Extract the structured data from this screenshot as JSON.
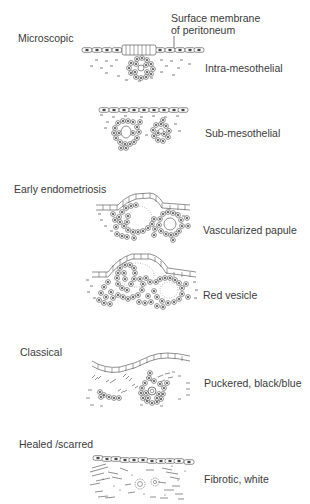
{
  "diagram": {
    "title_annotation": {
      "line1": "Surface membrane",
      "line2": "of peritoneum"
    },
    "sections": [
      {
        "heading": "Microscopic",
        "stages": [
          {
            "label": "Intra-mesothelial",
            "icon": "intra-mesothelial-lesion"
          },
          {
            "label": "Sub-mesothelial",
            "icon": "sub-mesothelial-lesion"
          }
        ]
      },
      {
        "heading": "Early endometriosis",
        "stages": [
          {
            "label": "Vascularized papule",
            "icon": "vascularized-papule-lesion"
          },
          {
            "label": "Red vesicle",
            "icon": "red-vesicle-lesion"
          }
        ]
      },
      {
        "heading": "Classical",
        "stages": [
          {
            "label": "Puckered, black/blue",
            "icon": "puckered-lesion"
          }
        ]
      },
      {
        "heading": "Healed /scarred",
        "stages": [
          {
            "label": "Fibrotic, white",
            "icon": "fibrotic-lesion"
          }
        ]
      }
    ]
  },
  "colors": {
    "ink": "#3a3a3a",
    "background": "#ffffff"
  }
}
